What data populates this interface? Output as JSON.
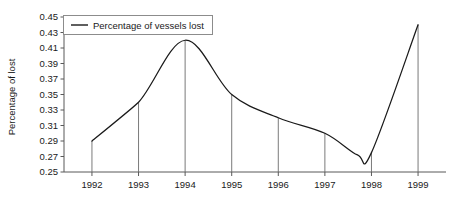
{
  "chart_data": {
    "type": "line",
    "title": "",
    "xlabel": "",
    "ylabel": "Percentage of lost",
    "legend": [
      "Percentage of vessels lost"
    ],
    "legend_position": "top-left",
    "grid": false,
    "xlim": [
      1991.4,
      1999.6
    ],
    "ylim": [
      0.25,
      0.45
    ],
    "x_tick_labels": [
      "1992",
      "1993",
      "1994",
      "1995",
      "1996",
      "1997",
      "1998",
      "1999"
    ],
    "y_tick_labels": [
      "0.25",
      "0.27",
      "0.29",
      "0.31",
      "0.33",
      "0.35",
      "0.37",
      "0.39",
      "0.41",
      "0.43",
      "0.45"
    ],
    "y_tick_values": [
      0.25,
      0.27,
      0.29,
      0.31,
      0.33,
      0.35,
      0.37,
      0.39,
      0.41,
      0.43,
      0.45
    ],
    "series": [
      {
        "name": "Percentage of vessels lost",
        "color": "#1a1a1a",
        "x": [
          1992,
          1993,
          1994,
          1995,
          1996,
          1997,
          1998,
          1999
        ],
        "values": [
          0.29,
          0.34,
          0.42,
          0.35,
          0.32,
          0.3,
          0.275,
          0.44
        ]
      }
    ],
    "annotations": [
      {
        "text": "local minimum",
        "x": 1997.7,
        "y": 0.272
      }
    ],
    "drop_lines_at": [
      1992,
      1993,
      1994,
      1995,
      1996,
      1997,
      1998,
      1999
    ]
  },
  "colors": {
    "series": "#1a1a1a",
    "axis": "#595959",
    "drop_line": "#6b6b6b",
    "legend_border": "#8c8c8c",
    "background": "#ffffff"
  }
}
